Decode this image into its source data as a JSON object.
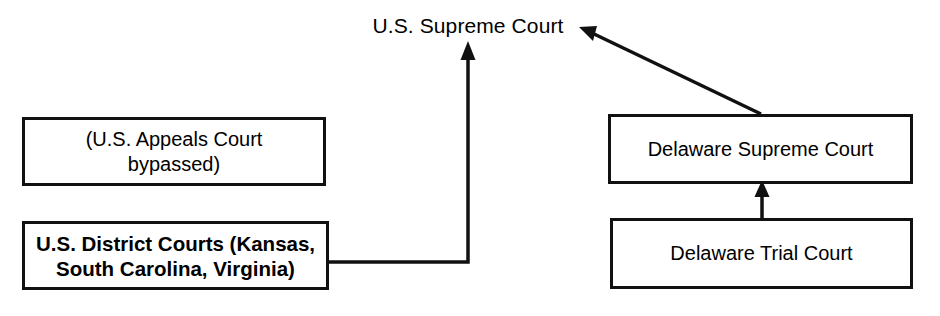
{
  "diagram": {
    "title_node": {
      "name": "u-s-supreme-court",
      "label": "U.S. Supreme Court"
    },
    "nodes": [
      {
        "name": "us-appeals-court-bypassed",
        "label": "(U.S. Appeals Court\nbypassed)"
      },
      {
        "name": "us-district-courts",
        "label": "U.S. District Courts (Kansas,\nSouth Carolina, Virginia)"
      },
      {
        "name": "delaware-supreme-court",
        "label": "Delaware Supreme Court"
      },
      {
        "name": "delaware-trial-court",
        "label": "Delaware Trial Court"
      }
    ],
    "edges": [
      {
        "name": "edge-district-to-us-supreme",
        "from": "us-district-courts",
        "to": "u-s-supreme-court",
        "style": "elbow",
        "arrow": "up"
      },
      {
        "name": "edge-delaware-supreme-to-us-supreme",
        "from": "delaware-supreme-court",
        "to": "u-s-supreme-court",
        "style": "diagonal",
        "arrow": "up-left"
      },
      {
        "name": "edge-delaware-trial-to-delaware-supreme",
        "from": "delaware-trial-court",
        "to": "delaware-supreme-court",
        "style": "straight",
        "arrow": "up"
      }
    ],
    "colors": {
      "stroke": "#111111",
      "text": "#000000",
      "background": "#ffffff"
    }
  }
}
